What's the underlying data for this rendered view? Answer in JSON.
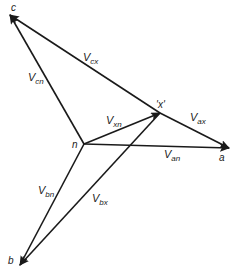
{
  "diagram": {
    "points": {
      "c": {
        "label": "c",
        "x": 10,
        "y": 15
      },
      "n": {
        "label": "n",
        "x": 84,
        "y": 144
      },
      "x": {
        "label": "'x'",
        "x": 160,
        "y": 113
      },
      "a": {
        "label": "a",
        "x": 229,
        "y": 148
      },
      "b": {
        "label": "b",
        "x": 20,
        "y": 265
      }
    },
    "vectors": [
      {
        "name": "V_cx",
        "main": "V",
        "sub": "cx",
        "from": "x",
        "to": "c"
      },
      {
        "name": "V_cn",
        "main": "V",
        "sub": "cn",
        "from": "n",
        "to": "c"
      },
      {
        "name": "V_xn",
        "main": "V",
        "sub": "xn",
        "from": "n",
        "to": "x"
      },
      {
        "name": "V_ax",
        "main": "V",
        "sub": "ax",
        "from": "x",
        "to": "a"
      },
      {
        "name": "V_an",
        "main": "V",
        "sub": "an",
        "from": "n",
        "to": "a"
      },
      {
        "name": "V_bn",
        "main": "V",
        "sub": "bn",
        "from": "n",
        "to": "b"
      },
      {
        "name": "V_bx",
        "main": "V",
        "sub": "bx",
        "from": "x",
        "to": "b"
      }
    ],
    "line_color": "#1a1a1a"
  }
}
